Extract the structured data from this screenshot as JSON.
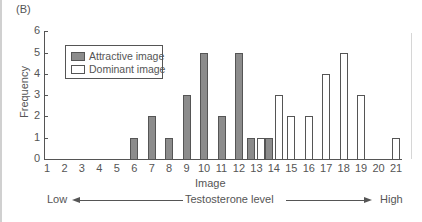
{
  "panel_label": "(B)",
  "chart_data": {
    "type": "bar",
    "title": "",
    "xlabel": "Image",
    "ylabel": "Frequency",
    "ylim": [
      0,
      6
    ],
    "yticks": [
      0,
      1,
      2,
      3,
      4,
      5,
      6
    ],
    "categories": [
      "1",
      "2",
      "3",
      "4",
      "5",
      "6",
      "7",
      "8",
      "9",
      "10",
      "11",
      "12",
      "13",
      "14",
      "15",
      "16",
      "17",
      "18",
      "19",
      "20",
      "21"
    ],
    "series": [
      {
        "name": "Attractive image",
        "color": "#8c8c8c",
        "values": [
          0,
          0,
          0,
          0,
          0,
          1,
          2,
          1,
          3,
          5,
          2,
          5,
          1,
          1,
          0,
          0,
          0,
          0,
          0,
          0,
          0
        ]
      },
      {
        "name": "Dominant image",
        "color": "#ffffff",
        "values": [
          0,
          0,
          0,
          0,
          0,
          0,
          0,
          0,
          0,
          0,
          0,
          0,
          1,
          3,
          2,
          2,
          4,
          5,
          3,
          0,
          1
        ]
      }
    ],
    "legend_position": "upper-left",
    "grid": false,
    "annotation": {
      "low": "Low",
      "high": "High",
      "label": "Testosterone level"
    }
  }
}
